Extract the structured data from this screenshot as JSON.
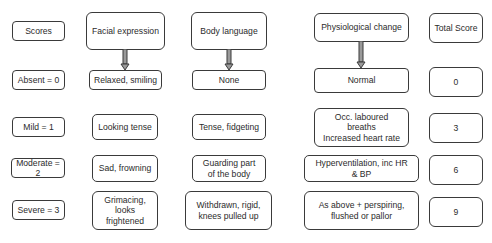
{
  "diagram": {
    "row_labels": {
      "header": "Scores",
      "absent": "Absent = 0",
      "mild": "Mild = 1",
      "moderate": "Moderate = 2",
      "severe": "Severe = 3"
    },
    "facial": {
      "header": "Facial expression",
      "absent": "Relaxed, smiling",
      "mild": "Looking tense",
      "moderate": "Sad, frowning",
      "severe": "Grimacing,\nlooks\nfrightened"
    },
    "body": {
      "header": "Body language",
      "absent": "None",
      "mild": "Tense, fidgeting",
      "moderate": "Guarding part\nof the body",
      "severe": "Withdrawn, rigid,\nknees pulled up"
    },
    "physio": {
      "header": "Physiological change",
      "absent": "Normal",
      "mild": "Occ. laboured\nbreaths\nIncreased heart rate",
      "moderate": "Hyperventilation, inc HR\n& BP",
      "severe": "As above + perspiring,\nflushed or pallor"
    },
    "total": {
      "header": "Total Score",
      "absent": "0",
      "mild": "3",
      "moderate": "6",
      "severe": "9"
    },
    "colors": {
      "border": "#3a3a3a",
      "arrow_fill": "#9a9a9a"
    }
  }
}
